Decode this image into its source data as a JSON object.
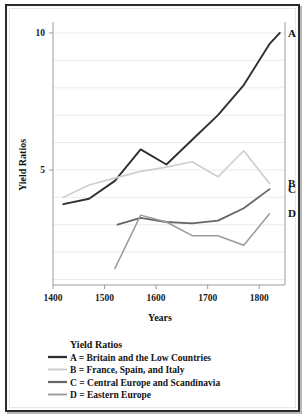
{
  "chart_data": {
    "type": "line",
    "title": "",
    "xlabel": "Years",
    "ylabel": "Yield Ratios",
    "xlim": [
      1400,
      1850
    ],
    "ylim": [
      0.8,
      10.4
    ],
    "xticks": [
      1400,
      1500,
      1600,
      1700,
      1800
    ],
    "xtick_labels": [
      "1400",
      "1500",
      "1600",
      "1700",
      "1800"
    ],
    "yticks": [
      5,
      10
    ],
    "ytick_labels": [
      "5",
      "10"
    ],
    "gridlines_y": [
      1,
      2,
      3,
      4,
      5,
      6,
      7,
      8,
      9,
      10
    ],
    "grid": true,
    "legend_position": "below-axes",
    "legend_title": "Yield Ratios",
    "series": [
      {
        "name": "A",
        "key": "A",
        "label": "A = Britain and the Low Countries",
        "end_label": "A",
        "color": "#2f2f2f",
        "width": 1.9,
        "x": [
          1420,
          1470,
          1520,
          1570,
          1620,
          1670,
          1720,
          1770,
          1820,
          1840
        ],
        "values": [
          3.75,
          3.95,
          4.6,
          5.75,
          5.2,
          6.1,
          7.0,
          8.1,
          9.6,
          10.0
        ]
      },
      {
        "name": "B",
        "key": "B",
        "label": "B = France, Spain, and Italy",
        "end_label": "B",
        "color": "#cfcfcf",
        "width": 1.7,
        "x": [
          1420,
          1470,
          1520,
          1570,
          1620,
          1670,
          1720,
          1770,
          1820
        ],
        "values": [
          4.0,
          4.45,
          4.7,
          4.95,
          5.1,
          5.3,
          4.75,
          5.7,
          4.5
        ]
      },
      {
        "name": "C",
        "key": "C",
        "label": "C = Central Europe and Scandinavia",
        "end_label": "C",
        "color": "#666666",
        "width": 1.8,
        "x": [
          1525,
          1570,
          1620,
          1670,
          1720,
          1770,
          1820
        ],
        "values": [
          3.0,
          3.25,
          3.1,
          3.05,
          3.15,
          3.6,
          4.3
        ]
      },
      {
        "name": "D",
        "key": "D",
        "label": "D = Eastern Europe",
        "end_label": "D",
        "color": "#9b9b9b",
        "width": 1.5,
        "x": [
          1520,
          1570,
          1620,
          1670,
          1720,
          1770,
          1820
        ],
        "values": [
          1.4,
          3.35,
          3.1,
          2.6,
          2.6,
          2.25,
          3.4
        ]
      }
    ]
  },
  "legend": {
    "title": "Yield Ratios",
    "entries": [
      {
        "label": "A = Britain and the Low Countries",
        "color": "#2f2f2f"
      },
      {
        "label": "B = France, Spain, and Italy",
        "color": "#cfcfcf"
      },
      {
        "label": "C = Central Europe and Scandinavia",
        "color": "#666666"
      },
      {
        "label": "D = Eastern Europe",
        "color": "#9b9b9b"
      }
    ]
  },
  "axes": {
    "y_title": "Yield Ratios",
    "x_title": "Years"
  }
}
